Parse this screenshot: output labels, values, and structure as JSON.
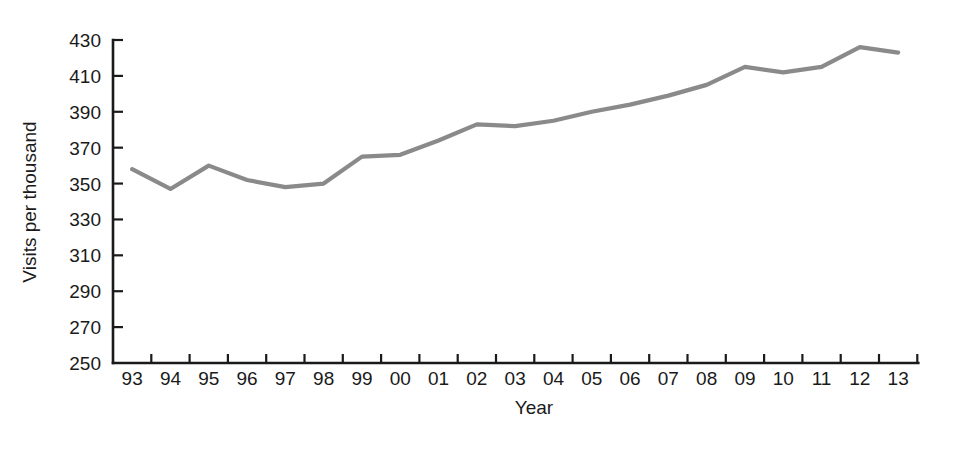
{
  "chart_data": {
    "type": "line",
    "title": "",
    "subtitle": "",
    "xlabel": "Year",
    "ylabel": "Visits per thousand",
    "categories": [
      "93",
      "94",
      "95",
      "96",
      "97",
      "98",
      "99",
      "00",
      "01",
      "02",
      "03",
      "04",
      "05",
      "06",
      "07",
      "08",
      "09",
      "10",
      "11",
      "12",
      "13"
    ],
    "series": [
      {
        "name": "Visits per thousand",
        "color": "#8a8a8a",
        "values": [
          358,
          347,
          360,
          352,
          348,
          350,
          365,
          366,
          374,
          383,
          382,
          385,
          390,
          394,
          399,
          405,
          415,
          412,
          415,
          426,
          423
        ]
      }
    ],
    "ylim": [
      250,
      430
    ],
    "ytick_values": [
      250,
      270,
      290,
      310,
      330,
      350,
      370,
      390,
      410,
      430
    ],
    "ytick_labels": [
      "250",
      "270",
      "290",
      "310",
      "330",
      "350",
      "370",
      "390",
      "410",
      "430"
    ],
    "xtick_labels": [
      "93",
      "94",
      "95",
      "96",
      "97",
      "98",
      "99",
      "00",
      "01",
      "02",
      "03",
      "04",
      "05",
      "06",
      "07",
      "08",
      "09",
      "10",
      "11",
      "12",
      "13"
    ],
    "grid": false,
    "legend": false,
    "legend_position": "none",
    "axis_color": "#1a1a1a",
    "background_color": "#ffffff"
  }
}
